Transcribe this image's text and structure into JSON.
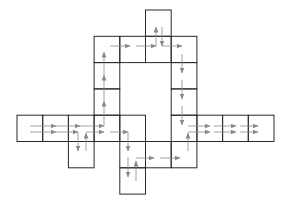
{
  "diagram": {
    "title": "",
    "grid": {
      "origin_x": 17,
      "origin_y": 10,
      "cell_w": 25.7,
      "cell_h": 26.3,
      "line_color": "#2a2a2a",
      "arrow_color": "#8a8a8a"
    },
    "cells": [
      {
        "r": 0,
        "c": 5
      },
      {
        "r": 1,
        "c": 3
      },
      {
        "r": 1,
        "c": 4
      },
      {
        "r": 1,
        "c": 5
      },
      {
        "r": 1,
        "c": 6
      },
      {
        "r": 2,
        "c": 3
      },
      {
        "r": 2,
        "c": 6
      },
      {
        "r": 3,
        "c": 3
      },
      {
        "r": 3,
        "c": 6
      },
      {
        "r": 4,
        "c": 0
      },
      {
        "r": 4,
        "c": 1
      },
      {
        "r": 4,
        "c": 2
      },
      {
        "r": 4,
        "c": 3
      },
      {
        "r": 4,
        "c": 4
      },
      {
        "r": 4,
        "c": 6
      },
      {
        "r": 4,
        "c": 7
      },
      {
        "r": 4,
        "c": 8
      },
      {
        "r": 4,
        "c": 9
      },
      {
        "r": 5,
        "c": 2
      },
      {
        "r": 5,
        "c": 4
      },
      {
        "r": 5,
        "c": 5
      },
      {
        "r": 5,
        "c": 6
      },
      {
        "r": 6,
        "c": 4
      }
    ],
    "arrows": [
      {
        "x1": 30,
        "y1": 126,
        "x2": 56,
        "y2": 126
      },
      {
        "x1": 56,
        "y1": 126,
        "x2": 80,
        "y2": 126
      },
      {
        "x1": 80,
        "y1": 126,
        "x2": 104,
        "y2": 126
      },
      {
        "x1": 104,
        "y1": 126,
        "x2": 104,
        "y2": 101
      },
      {
        "x1": 104,
        "y1": 101,
        "x2": 104,
        "y2": 75
      },
      {
        "x1": 104,
        "y1": 75,
        "x2": 104,
        "y2": 52
      },
      {
        "x1": 110,
        "y1": 46,
        "x2": 130,
        "y2": 46
      },
      {
        "x1": 136,
        "y1": 46,
        "x2": 156,
        "y2": 46
      },
      {
        "x1": 156,
        "y1": 46,
        "x2": 156,
        "y2": 27
      },
      {
        "x1": 162,
        "y1": 27,
        "x2": 162,
        "y2": 46
      },
      {
        "x1": 162,
        "y1": 46,
        "x2": 182,
        "y2": 46
      },
      {
        "x1": 182,
        "y1": 54,
        "x2": 182,
        "y2": 73
      },
      {
        "x1": 182,
        "y1": 80,
        "x2": 182,
        "y2": 99
      },
      {
        "x1": 182,
        "y1": 106,
        "x2": 182,
        "y2": 125
      },
      {
        "x1": 188,
        "y1": 126,
        "x2": 210,
        "y2": 126
      },
      {
        "x1": 214,
        "y1": 126,
        "x2": 236,
        "y2": 126
      },
      {
        "x1": 240,
        "y1": 126,
        "x2": 258,
        "y2": 126
      },
      {
        "x1": 30,
        "y1": 132,
        "x2": 56,
        "y2": 132
      },
      {
        "x1": 56,
        "y1": 132,
        "x2": 78,
        "y2": 132
      },
      {
        "x1": 78,
        "y1": 132,
        "x2": 78,
        "y2": 151
      },
      {
        "x1": 86,
        "y1": 151,
        "x2": 86,
        "y2": 133
      },
      {
        "x1": 86,
        "y1": 132,
        "x2": 104,
        "y2": 132
      },
      {
        "x1": 110,
        "y1": 132,
        "x2": 128,
        "y2": 132
      },
      {
        "x1": 128,
        "y1": 132,
        "x2": 128,
        "y2": 151
      },
      {
        "x1": 128,
        "y1": 157,
        "x2": 128,
        "y2": 177
      },
      {
        "x1": 136,
        "y1": 181,
        "x2": 136,
        "y2": 161
      },
      {
        "x1": 136,
        "y1": 158,
        "x2": 154,
        "y2": 158
      },
      {
        "x1": 160,
        "y1": 158,
        "x2": 180,
        "y2": 158
      },
      {
        "x1": 188,
        "y1": 151,
        "x2": 188,
        "y2": 133
      },
      {
        "x1": 188,
        "y1": 132,
        "x2": 210,
        "y2": 132
      },
      {
        "x1": 214,
        "y1": 132,
        "x2": 236,
        "y2": 132
      },
      {
        "x1": 240,
        "y1": 132,
        "x2": 258,
        "y2": 132
      }
    ]
  }
}
